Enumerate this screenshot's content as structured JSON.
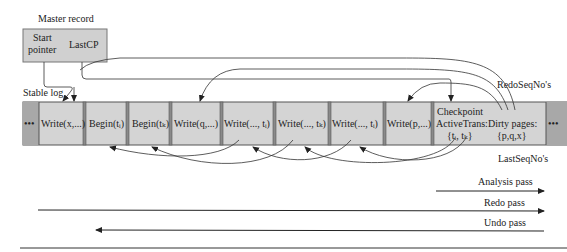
{
  "master_record": {
    "title": "Master record",
    "start_pointer_line1": "Start",
    "start_pointer_line2": "pointer",
    "last_cp": "LastCP"
  },
  "stable_log": {
    "label": "Stable log",
    "cells": [
      {
        "text": "•••",
        "kind": "ellipsis"
      },
      {
        "text": "Write(x,...)"
      },
      {
        "text": "Begin(tᵢ)"
      },
      {
        "text": "Begin(tₖ)"
      },
      {
        "text": "Write(q,...)"
      },
      {
        "text": "Write(..., tᵢ)"
      },
      {
        "text": "Write(..., tₖ)"
      },
      {
        "text": "Write(..., tᵢ)"
      },
      {
        "text": "Write(p,...)"
      },
      {
        "line1": "Checkpoint",
        "line2": "ActiveTrans:",
        "line3": "{tᵢ, tₖ}"
      },
      {
        "line1": "Dirty pages:",
        "line2": "{p,q,x}"
      },
      {
        "text": "•••",
        "kind": "ellipsis"
      }
    ]
  },
  "labels": {
    "redo_seq": "RedoSeqNo's",
    "last_seq": "LastSeqNo's"
  },
  "passes": [
    {
      "label": "Analysis pass",
      "direction": "right"
    },
    {
      "label": "Redo pass",
      "direction": "right"
    },
    {
      "label": "Undo pass",
      "direction": "left"
    }
  ],
  "colors": {
    "cell_fill": "#d4d4d4",
    "end_fill": "#a8a8a8",
    "separator": "#6e6e6e",
    "master_fill": "#d0d0d0"
  }
}
